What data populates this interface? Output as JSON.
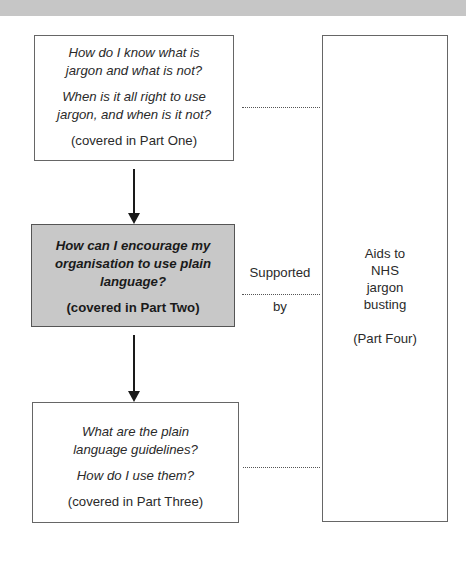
{
  "diagram": {
    "box_one": {
      "question_1": "How do I know what is jargon and what is not?",
      "question_1_line1": "How do I know what is",
      "question_1_line2": "jargon and what is not?",
      "question_2_line1": "When is it all right to use",
      "question_2_line2": "jargon, and when is it not?",
      "note": "(covered in Part One)"
    },
    "box_two": {
      "question_line1": "How can I encourage my",
      "question_line2": "organisation to use plain",
      "question_line3": "language?",
      "note": "(covered in Part Two)",
      "fill_color": "#c8c8c8"
    },
    "box_three": {
      "question_1_line1": "What are the plain",
      "question_1_line2": "language guidelines?",
      "question_2": "How do I use them?",
      "note": "(covered in Part Three)"
    },
    "box_four": {
      "line1": "Aids to",
      "line2": "NHS",
      "line3": "jargon",
      "line4": "busting",
      "note": "(Part Four)"
    },
    "connector_label_top": "Supported",
    "connector_label_bottom": "by"
  }
}
